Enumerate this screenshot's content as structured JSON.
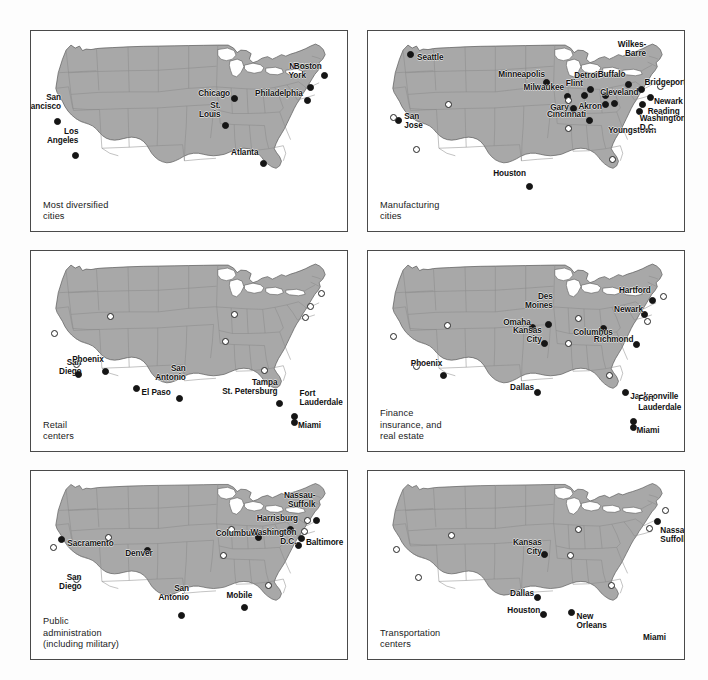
{
  "figure": {
    "background": "#fdfdfd",
    "land_color": "#a8a8a8",
    "water_color": "#ffffff",
    "border_color": "#8a8a8a",
    "outline_color": "#555555",
    "panel_border_color": "#4a4a4a",
    "dot_filled_color": "#151515",
    "dot_open_color": "#ffffff",
    "panel_count": 6
  },
  "panels": [
    {
      "id": "most-diversified-cities",
      "caption": "Most diversified\ncities",
      "cities": [
        {
          "name": "San\nFrancisco",
          "x": 8.5,
          "y": 45.0,
          "marker": "filled",
          "anchor": "rt",
          "lx": 9.5,
          "ly": 40.0
        },
        {
          "name": "Los\nAngeles",
          "x": 14.0,
          "y": 62.0,
          "marker": "filled",
          "anchor": "rt",
          "lx": 15.0,
          "ly": 57.0
        },
        {
          "name": "Chicago",
          "x": 64.5,
          "y": 33.5,
          "marker": "filled",
          "anchor": "rt",
          "lx": 63.0,
          "ly": 33.5
        },
        {
          "name": "St.\nLouis",
          "x": 61.5,
          "y": 47.0,
          "marker": "filled",
          "anchor": "rt",
          "lx": 60.0,
          "ly": 44.0
        },
        {
          "name": "Atlanta",
          "x": 73.5,
          "y": 66.0,
          "marker": "filled",
          "anchor": "rt",
          "lx": 72.0,
          "ly": 63.0
        },
        {
          "name": "Philadelphia",
          "x": 87.5,
          "y": 34.5,
          "marker": "filled",
          "anchor": "rt",
          "lx": 86.0,
          "ly": 33.5
        },
        {
          "name": "New\nYork",
          "x": 88.5,
          "y": 28.0,
          "marker": "filled",
          "anchor": "rt",
          "lx": 87.0,
          "ly": 24.5
        },
        {
          "name": "Boston",
          "x": 93.0,
          "y": 22.0,
          "marker": "filled",
          "anchor": "rt",
          "lx": 92.0,
          "ly": 20.0
        }
      ]
    },
    {
      "id": "manufacturing-cities",
      "caption": "Manufacturing\ncities",
      "cities": [
        {
          "name": "Seattle",
          "x": 13.5,
          "y": 11.5,
          "marker": "filled",
          "anchor": "lb",
          "lx": 15.5,
          "ly": 11.0
        },
        {
          "name": "San\nJose",
          "x": 9.5,
          "y": 44.5,
          "marker": "filled",
          "anchor": "lb",
          "lx": 11.5,
          "ly": 40.5
        },
        {
          "name": "",
          "x": 8.0,
          "y": 43.0,
          "marker": "open",
          "anchor": "lb",
          "lx": 8.0,
          "ly": 43.0
        },
        {
          "name": "",
          "x": 15.5,
          "y": 59.0,
          "marker": "open",
          "anchor": "lb",
          "lx": 15.5,
          "ly": 59.0
        },
        {
          "name": "",
          "x": 25.5,
          "y": 36.5,
          "marker": "open",
          "anchor": "lb",
          "lx": 25.5,
          "ly": 36.5
        },
        {
          "name": "Minneapolis",
          "x": 56.5,
          "y": 25.5,
          "marker": "filled",
          "anchor": "rt",
          "lx": 56.0,
          "ly": 24.0
        },
        {
          "name": "Milwaukee",
          "x": 63.0,
          "y": 32.5,
          "marker": "filled",
          "anchor": "rt",
          "lx": 62.0,
          "ly": 30.5
        },
        {
          "name": "Gary",
          "x": 65.0,
          "y": 38.5,
          "marker": "filled",
          "anchor": "rt",
          "lx": 63.5,
          "ly": 40.5
        },
        {
          "name": "",
          "x": 63.5,
          "y": 34.5,
          "marker": "open",
          "anchor": "lb",
          "lx": 63.5,
          "ly": 34.5
        },
        {
          "name": "Cincinnati",
          "x": 70.0,
          "y": 44.5,
          "marker": "filled",
          "anchor": "rt",
          "lx": 69.0,
          "ly": 44.0
        },
        {
          "name": "",
          "x": 63.5,
          "y": 48.5,
          "marker": "open",
          "anchor": "lb",
          "lx": 63.5,
          "ly": 48.5
        },
        {
          "name": "Flint",
          "x": 68.5,
          "y": 32.0,
          "marker": "filled",
          "anchor": "rt",
          "lx": 68.0,
          "ly": 28.5
        },
        {
          "name": "Detroit",
          "x": 70.5,
          "y": 29.0,
          "marker": "filled",
          "anchor": "rt",
          "lx": 73.5,
          "ly": 24.5
        },
        {
          "name": "Cleveland",
          "x": 75.0,
          "y": 32.0,
          "marker": "filled",
          "anchor": "lb",
          "lx": 73.5,
          "ly": 28.5
        },
        {
          "name": "Akron",
          "x": 75.0,
          "y": 36.5,
          "marker": "filled",
          "anchor": "rt",
          "lx": 74.0,
          "ly": 40.0
        },
        {
          "name": "Youngstown",
          "x": 78.0,
          "y": 36.0,
          "marker": "filled",
          "anchor": "lb",
          "lx": 76.0,
          "ly": 47.5
        },
        {
          "name": "Buffalo",
          "x": 82.5,
          "y": 26.5,
          "marker": "filled",
          "anchor": "rt",
          "lx": 81.5,
          "ly": 24.0
        },
        {
          "name": "Wilkes-\nBarre",
          "x": 86.5,
          "y": 29.0,
          "marker": "filled",
          "anchor": "rt",
          "lx": 88.0,
          "ly": 13.5
        },
        {
          "name": "Bridgeport",
          "x": 92.5,
          "y": 27.5,
          "marker": "open",
          "anchor": "lb",
          "lx": 87.5,
          "ly": 23.5
        },
        {
          "name": "Reading",
          "x": 87.0,
          "y": 36.5,
          "marker": "filled",
          "anchor": "lb",
          "lx": 88.5,
          "ly": 38.0
        },
        {
          "name": "Newark",
          "x": 89.5,
          "y": 33.0,
          "marker": "filled",
          "anchor": "lb",
          "lx": 90.5,
          "ly": 33.0
        },
        {
          "name": "Washington\nD.C.",
          "x": 86.0,
          "y": 40.0,
          "marker": "filled",
          "anchor": "lb",
          "lx": 86.0,
          "ly": 41.5
        },
        {
          "name": "",
          "x": 77.5,
          "y": 64.0,
          "marker": "open",
          "anchor": "lb",
          "lx": 77.5,
          "ly": 64.0
        },
        {
          "name": "Houston",
          "x": 51.0,
          "y": 77.5,
          "marker": "filled",
          "anchor": "rt",
          "lx": 50.0,
          "ly": 73.5
        }
      ]
    },
    {
      "id": "retail-centers",
      "caption": "Retail\ncenters",
      "cities": [
        {
          "name": "",
          "x": 7.5,
          "y": 41.0,
          "marker": "open",
          "anchor": "lb",
          "lx": 7.5,
          "ly": 41.0
        },
        {
          "name": "San\nDiego",
          "x": 14.5,
          "y": 56.5,
          "marker": "open",
          "anchor": "rt",
          "lx": 16.0,
          "ly": 62.5
        },
        {
          "name": "",
          "x": 15.0,
          "y": 61.5,
          "marker": "filled",
          "anchor": "lb",
          "lx": 15.0,
          "ly": 61.5
        },
        {
          "name": "",
          "x": 25.0,
          "y": 32.5,
          "marker": "open",
          "anchor": "lb",
          "lx": 25.0,
          "ly": 32.5
        },
        {
          "name": "Phoenix",
          "x": 23.5,
          "y": 60.0,
          "marker": "filled",
          "anchor": "rt",
          "lx": 23.0,
          "ly": 56.5
        },
        {
          "name": "El Paso",
          "x": 33.5,
          "y": 68.5,
          "marker": "filled",
          "anchor": "lb",
          "lx": 35.0,
          "ly": 68.5
        },
        {
          "name": "San\nAntonio",
          "x": 47.0,
          "y": 73.5,
          "marker": "filled",
          "anchor": "rt",
          "lx": 49.0,
          "ly": 65.5
        },
        {
          "name": "",
          "x": 64.5,
          "y": 31.5,
          "marker": "open",
          "anchor": "lb",
          "lx": 64.5,
          "ly": 31.5
        },
        {
          "name": "",
          "x": 61.5,
          "y": 45.0,
          "marker": "open",
          "anchor": "lb",
          "lx": 61.5,
          "ly": 45.0
        },
        {
          "name": "",
          "x": 74.0,
          "y": 59.5,
          "marker": "open",
          "anchor": "lb",
          "lx": 74.0,
          "ly": 59.5
        },
        {
          "name": "Tampa\nSt. Petersburg",
          "x": 78.5,
          "y": 76.0,
          "marker": "filled",
          "anchor": "rt",
          "lx": 78.0,
          "ly": 72.5
        },
        {
          "name": "Fort\nLauderdale",
          "x": 83.5,
          "y": 82.5,
          "marker": "filled",
          "anchor": "lt",
          "lx": 85.0,
          "ly": 78.0
        },
        {
          "name": "Miami",
          "x": 83.5,
          "y": 85.5,
          "marker": "filled",
          "anchor": "lb",
          "lx": 84.5,
          "ly": 85.0
        },
        {
          "name": "",
          "x": 92.0,
          "y": 21.0,
          "marker": "open",
          "anchor": "lb",
          "lx": 92.0,
          "ly": 21.0
        },
        {
          "name": "",
          "x": 88.5,
          "y": 27.5,
          "marker": "open",
          "anchor": "lb",
          "lx": 88.5,
          "ly": 27.5
        },
        {
          "name": "",
          "x": 87.0,
          "y": 33.0,
          "marker": "open",
          "anchor": "lb",
          "lx": 87.0,
          "ly": 33.0
        }
      ]
    },
    {
      "id": "finance-insurance-real-estate",
      "caption": "Finance\ninsurance, and\nreal estate",
      "cities": [
        {
          "name": "",
          "x": 8.0,
          "y": 42.5,
          "marker": "open",
          "anchor": "lb",
          "lx": 8.0,
          "ly": 42.5
        },
        {
          "name": "",
          "x": 15.5,
          "y": 57.5,
          "marker": "open",
          "anchor": "lb",
          "lx": 15.5,
          "ly": 57.5
        },
        {
          "name": "",
          "x": 25.0,
          "y": 37.0,
          "marker": "open",
          "anchor": "lb",
          "lx": 25.0,
          "ly": 37.0
        },
        {
          "name": "Phoenix",
          "x": 24.0,
          "y": 62.0,
          "marker": "filled",
          "anchor": "rt",
          "lx": 23.5,
          "ly": 58.5
        },
        {
          "name": "Omaha",
          "x": 52.0,
          "y": 38.0,
          "marker": "filled",
          "anchor": "rt",
          "lx": 51.5,
          "ly": 38.0
        },
        {
          "name": "Des\nMoines",
          "x": 57.0,
          "y": 36.5,
          "marker": "filled",
          "anchor": "rt",
          "lx": 58.5,
          "ly": 29.5
        },
        {
          "name": "Kansas\nCity",
          "x": 56.0,
          "y": 46.0,
          "marker": "filled",
          "anchor": "rt",
          "lx": 55.0,
          "ly": 46.5
        },
        {
          "name": "",
          "x": 63.5,
          "y": 46.0,
          "marker": "open",
          "anchor": "lb",
          "lx": 63.5,
          "ly": 46.0
        },
        {
          "name": "",
          "x": 66.5,
          "y": 33.5,
          "marker": "open",
          "anchor": "lb",
          "lx": 66.5,
          "ly": 33.5
        },
        {
          "name": "Dallas",
          "x": 53.5,
          "y": 70.5,
          "marker": "filled",
          "anchor": "rt",
          "lx": 52.5,
          "ly": 70.5
        },
        {
          "name": "Columbus",
          "x": 74.5,
          "y": 38.5,
          "marker": "filled",
          "anchor": "rt",
          "lx": 77.5,
          "ly": 43.0
        },
        {
          "name": "Richmond",
          "x": 85.0,
          "y": 46.5,
          "marker": "filled",
          "anchor": "rt",
          "lx": 84.0,
          "ly": 46.5
        },
        {
          "name": "Hartford",
          "x": 90.0,
          "y": 24.5,
          "marker": "filled",
          "anchor": "rt",
          "lx": 89.5,
          "ly": 22.0
        },
        {
          "name": "",
          "x": 93.5,
          "y": 22.5,
          "marker": "open",
          "anchor": "lb",
          "lx": 93.5,
          "ly": 22.5
        },
        {
          "name": "Newark",
          "x": 87.5,
          "y": 31.5,
          "marker": "filled",
          "anchor": "rt",
          "lx": 87.0,
          "ly": 31.5
        },
        {
          "name": "",
          "x": 88.5,
          "y": 35.0,
          "marker": "open",
          "anchor": "lb",
          "lx": 88.5,
          "ly": 35.0
        },
        {
          "name": "",
          "x": 76.5,
          "y": 62.0,
          "marker": "open",
          "anchor": "lb",
          "lx": 76.5,
          "ly": 62.0
        },
        {
          "name": "Jacksonville",
          "x": 81.5,
          "y": 70.5,
          "marker": "filled",
          "anchor": "lb",
          "lx": 83.0,
          "ly": 70.5
        },
        {
          "name": "Fort\nLauderdale",
          "x": 84.0,
          "y": 85.0,
          "marker": "filled",
          "anchor": "lt",
          "lx": 85.5,
          "ly": 80.5
        },
        {
          "name": "Miami",
          "x": 84.0,
          "y": 88.0,
          "marker": "filled",
          "anchor": "lb",
          "lx": 85.0,
          "ly": 87.5
        }
      ]
    },
    {
      "id": "public-administration",
      "caption": "Public\nadministration\n(including military)",
      "cities": [
        {
          "name": "",
          "x": 7.0,
          "y": 40.5,
          "marker": "open",
          "anchor": "lb",
          "lx": 7.0,
          "ly": 40.5
        },
        {
          "name": "Sacramento",
          "x": 9.5,
          "y": 36.5,
          "marker": "filled",
          "anchor": "lb",
          "lx": 11.5,
          "ly": 36.0
        },
        {
          "name": "San\nDiego",
          "x": 14.5,
          "y": 57.5,
          "marker": "open",
          "anchor": "rt",
          "lx": 16.0,
          "ly": 64.0
        },
        {
          "name": "Denver",
          "x": 37.0,
          "y": 42.5,
          "marker": "filled",
          "anchor": "rt",
          "lx": 38.5,
          "ly": 46.5
        },
        {
          "name": "",
          "x": 24.5,
          "y": 35.5,
          "marker": "open",
          "anchor": "lb",
          "lx": 24.5,
          "ly": 35.5
        },
        {
          "name": "San\nAntonio",
          "x": 47.5,
          "y": 77.0,
          "marker": "filled",
          "anchor": "rt",
          "lx": 50.0,
          "ly": 69.5
        },
        {
          "name": "",
          "x": 63.5,
          "y": 31.0,
          "marker": "open",
          "anchor": "lb",
          "lx": 63.5,
          "ly": 31.0
        },
        {
          "name": "",
          "x": 61.0,
          "y": 45.0,
          "marker": "open",
          "anchor": "lb",
          "lx": 61.0,
          "ly": 45.0
        },
        {
          "name": "Columbus",
          "x": 72.0,
          "y": 35.5,
          "marker": "filled",
          "anchor": "rt",
          "lx": 71.0,
          "ly": 35.5
        },
        {
          "name": "Harrisburg",
          "x": 82.0,
          "y": 31.0,
          "marker": "filled",
          "anchor": "rt",
          "lx": 84.5,
          "ly": 27.5
        },
        {
          "name": "Nassau-\nSuffolk",
          "x": 90.5,
          "y": 26.5,
          "marker": "filled",
          "anchor": "rt",
          "lx": 90.0,
          "ly": 20.0
        },
        {
          "name": "",
          "x": 87.5,
          "y": 26.5,
          "marker": "open",
          "anchor": "lb",
          "lx": 87.5,
          "ly": 26.5
        },
        {
          "name": "",
          "x": 86.5,
          "y": 32.0,
          "marker": "open",
          "anchor": "lb",
          "lx": 86.5,
          "ly": 32.0
        },
        {
          "name": "Baltimore",
          "x": 85.5,
          "y": 36.0,
          "marker": "filled",
          "anchor": "lb",
          "lx": 87.0,
          "ly": 35.5
        },
        {
          "name": "Washington\nD.C.",
          "x": 84.5,
          "y": 39.5,
          "marker": "filled",
          "anchor": "rt",
          "lx": 84.0,
          "ly": 40.0
        },
        {
          "name": "",
          "x": 75.0,
          "y": 61.0,
          "marker": "open",
          "anchor": "lb",
          "lx": 75.0,
          "ly": 61.0
        },
        {
          "name": "Mobile",
          "x": 67.5,
          "y": 72.5,
          "marker": "filled",
          "anchor": "rt",
          "lx": 70.0,
          "ly": 68.5
        }
      ]
    },
    {
      "id": "transportation-centers",
      "caption": "Transportation\ncenters",
      "cities": [
        {
          "name": "",
          "x": 9.0,
          "y": 41.5,
          "marker": "open",
          "anchor": "lb",
          "lx": 9.0,
          "ly": 41.5
        },
        {
          "name": "",
          "x": 16.0,
          "y": 56.5,
          "marker": "open",
          "anchor": "lb",
          "lx": 16.0,
          "ly": 56.5
        },
        {
          "name": "",
          "x": 26.5,
          "y": 34.5,
          "marker": "open",
          "anchor": "lb",
          "lx": 26.5,
          "ly": 34.5
        },
        {
          "name": "Kansas\nCity",
          "x": 56.0,
          "y": 44.5,
          "marker": "filled",
          "anchor": "rt",
          "lx": 55.0,
          "ly": 45.0
        },
        {
          "name": "",
          "x": 66.5,
          "y": 31.0,
          "marker": "open",
          "anchor": "lb",
          "lx": 66.5,
          "ly": 31.0
        },
        {
          "name": "",
          "x": 64.0,
          "y": 45.0,
          "marker": "open",
          "anchor": "lb",
          "lx": 64.0,
          "ly": 45.0
        },
        {
          "name": "Dallas",
          "x": 53.5,
          "y": 67.5,
          "marker": "filled",
          "anchor": "rt",
          "lx": 52.5,
          "ly": 67.5
        },
        {
          "name": "Houston",
          "x": 55.5,
          "y": 76.5,
          "marker": "filled",
          "anchor": "rt",
          "lx": 54.5,
          "ly": 76.5
        },
        {
          "name": "New\nOrleans",
          "x": 64.5,
          "y": 75.5,
          "marker": "filled",
          "anchor": "lb",
          "lx": 66.0,
          "ly": 75.0
        },
        {
          "name": "",
          "x": 77.0,
          "y": 61.0,
          "marker": "open",
          "anchor": "lb",
          "lx": 77.0,
          "ly": 61.0
        },
        {
          "name": "Nassau-\nSuffolk",
          "x": 91.5,
          "y": 27.0,
          "marker": "filled",
          "anchor": "lb",
          "lx": 92.5,
          "ly": 29.0
        },
        {
          "name": "",
          "x": 94.0,
          "y": 21.0,
          "marker": "open",
          "anchor": "lb",
          "lx": 94.0,
          "ly": 21.0
        },
        {
          "name": "",
          "x": 89.0,
          "y": 30.5,
          "marker": "open",
          "anchor": "lb",
          "lx": 89.0,
          "ly": 30.5
        },
        {
          "name": "Miami",
          "x": 86.5,
          "y": 87.0,
          "marker": "none",
          "anchor": "lb",
          "lx": 87.0,
          "ly": 86.0
        }
      ]
    }
  ]
}
